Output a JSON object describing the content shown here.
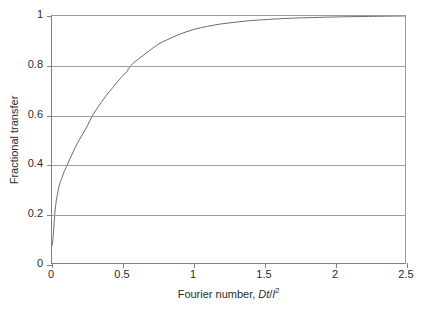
{
  "chart_data": {
    "type": "line",
    "title": "",
    "xlabel_plain": "Fourier number, Dt/l2",
    "xlabel_parts": {
      "prefix": "Fourier number, ",
      "numerator": "Dt",
      "slash": "/",
      "denominator": "l",
      "exponent": "2"
    },
    "ylabel": "Fractional transfer",
    "xlim": [
      0,
      2.5
    ],
    "ylim": [
      0,
      1
    ],
    "xticks": [
      "0",
      "0.5",
      "1",
      "1.5",
      "2",
      "2.5"
    ],
    "xtick_values": [
      0,
      0.5,
      1,
      1.5,
      2,
      2.5
    ],
    "yticks": [
      "0",
      "0.2",
      "0.4",
      "0.6",
      "0.8",
      "1"
    ],
    "ytick_values": [
      0,
      0.2,
      0.4,
      0.6,
      0.8,
      1
    ],
    "grid": "horizontal",
    "gridline_values": [
      0.2,
      0.4,
      0.6,
      0.8,
      1
    ],
    "legend": "none",
    "line_color": "#6b6b6b",
    "grid_color": "#9d9d9d",
    "axis_color": "#808080",
    "background_color": "#ffffff",
    "series": [
      {
        "name": "Fractional transfer",
        "x": [
          0,
          0.005,
          0.01,
          0.02,
          0.03,
          0.05,
          0.07,
          0.09,
          0.11,
          0.13,
          0.15,
          0.18,
          0.21,
          0.25,
          0.29,
          0.33,
          0.38,
          0.43,
          0.48,
          0.53,
          0.56,
          0.62,
          0.68,
          0.75,
          0.82,
          0.9,
          1.0,
          1.1,
          1.2,
          1.3,
          1.4,
          1.5,
          1.65,
          1.8,
          2.0,
          2.2,
          2.35,
          2.5
        ],
        "y": [
          0.07,
          0.085,
          0.12,
          0.2,
          0.25,
          0.31,
          0.345,
          0.375,
          0.4,
          0.425,
          0.45,
          0.485,
          0.515,
          0.555,
          0.6,
          0.635,
          0.675,
          0.71,
          0.745,
          0.775,
          0.8,
          0.83,
          0.855,
          0.885,
          0.905,
          0.925,
          0.945,
          0.958,
          0.968,
          0.975,
          0.981,
          0.985,
          0.99,
          0.993,
          0.996,
          0.998,
          0.999,
          1.0
        ]
      }
    ]
  }
}
